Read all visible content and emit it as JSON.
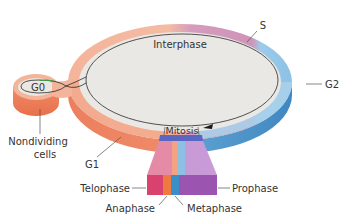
{
  "diagram": {
    "labels": {
      "s": "S",
      "interphase": "Interphase",
      "g0": "G0",
      "g2": "G2",
      "nondividing_line1": "Nondividing",
      "nondividing_line2": "cells",
      "g1": "G1",
      "mitosis": "Mitosis",
      "telophase": "Telophase",
      "prophase": "Prophase",
      "anaphase": "Anaphase",
      "metaphase": "Metaphase"
    },
    "phases": [
      {
        "name": "G1",
        "color": "#ee8e6e"
      },
      {
        "name": "S",
        "color": "#c98aae"
      },
      {
        "name": "G2",
        "color": "#7fb6dc"
      },
      {
        "name": "Mitosis",
        "color": "#5a67c2"
      },
      {
        "name": "G0",
        "color": "#ee8e6e"
      }
    ],
    "mitosis_subphases": [
      {
        "name": "Telophase",
        "color": "#d9416e"
      },
      {
        "name": "Anaphase",
        "color": "#ee7a42"
      },
      {
        "name": "Metaphase",
        "color": "#3a8fc6"
      },
      {
        "name": "Prophase",
        "color": "#9b55b0"
      }
    ],
    "colors": {
      "inner_disc": "#e9e8e4",
      "g1_ring": "#f3b79e",
      "g1_side": "#ec7f5e",
      "s_ring": "#cf96b8",
      "g2_ring": "#a9cfe9",
      "g2_side": "#4c95c9",
      "cycle_line": "#2a2a2a"
    }
  }
}
